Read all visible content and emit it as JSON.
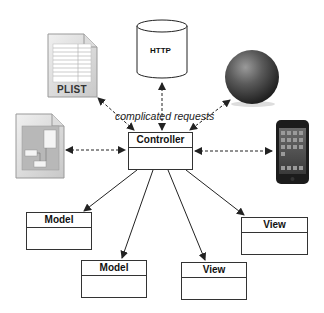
{
  "diagram": {
    "title_annotation": "complicated requests",
    "controller": {
      "label": "Controller"
    },
    "sources": [
      {
        "id": "plist",
        "label": "PLIST",
        "icon": "plist-file-icon"
      },
      {
        "id": "http",
        "label": "HTTP",
        "icon": "database-cylinder-icon"
      },
      {
        "id": "web",
        "label": "",
        "icon": "globe-sphere-icon"
      },
      {
        "id": "doc",
        "label": "",
        "icon": "document-file-icon"
      },
      {
        "id": "device",
        "label": "",
        "icon": "iphone-icon"
      }
    ],
    "models": [
      {
        "label": "Model"
      },
      {
        "label": "Model"
      }
    ],
    "views": [
      {
        "label": "View"
      },
      {
        "label": "View"
      }
    ],
    "colors": {
      "line": "#222222",
      "box_border": "#333333",
      "background": "#ffffff"
    }
  }
}
